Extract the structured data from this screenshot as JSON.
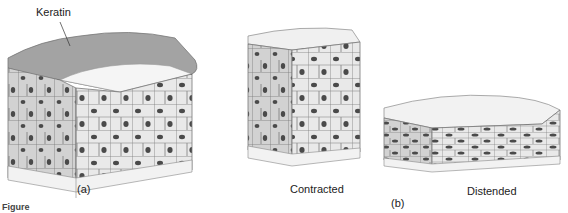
{
  "figure": {
    "panel_a": {
      "label": "(a)",
      "annotation": "Keratin"
    },
    "panel_b": {
      "label": "(b)",
      "left_caption": "Contracted",
      "right_caption": "Distended"
    },
    "figure_caption": "Figure",
    "colors": {
      "cell_fill": "#e8e8e8",
      "cell_side_fill": "#cfcfcf",
      "cell_outline": "#7a7a7a",
      "nucleus": "#4a4a4a",
      "keratin": "#9a9a9a",
      "connective": "#f2f2f2"
    }
  }
}
